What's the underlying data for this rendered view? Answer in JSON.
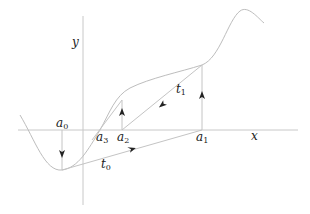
{
  "diagram": {
    "axes": {
      "x_label": "x",
      "y_label": "y"
    },
    "points": [
      {
        "id": "a0",
        "base": "a",
        "sub": "0"
      },
      {
        "id": "a1",
        "base": "a",
        "sub": "1"
      },
      {
        "id": "a2",
        "base": "a",
        "sub": "2"
      },
      {
        "id": "a3",
        "base": "a",
        "sub": "3"
      }
    ],
    "secants": [
      {
        "id": "t0",
        "base": "t",
        "sub": "0",
        "from": "a0",
        "to": "a1"
      },
      {
        "id": "t1",
        "base": "t",
        "sub": "1",
        "from": "a1",
        "to": "a2"
      }
    ],
    "colors": {
      "curve": "#bdbdbd",
      "axis": "#c8c8c8",
      "text": "#222222"
    }
  }
}
